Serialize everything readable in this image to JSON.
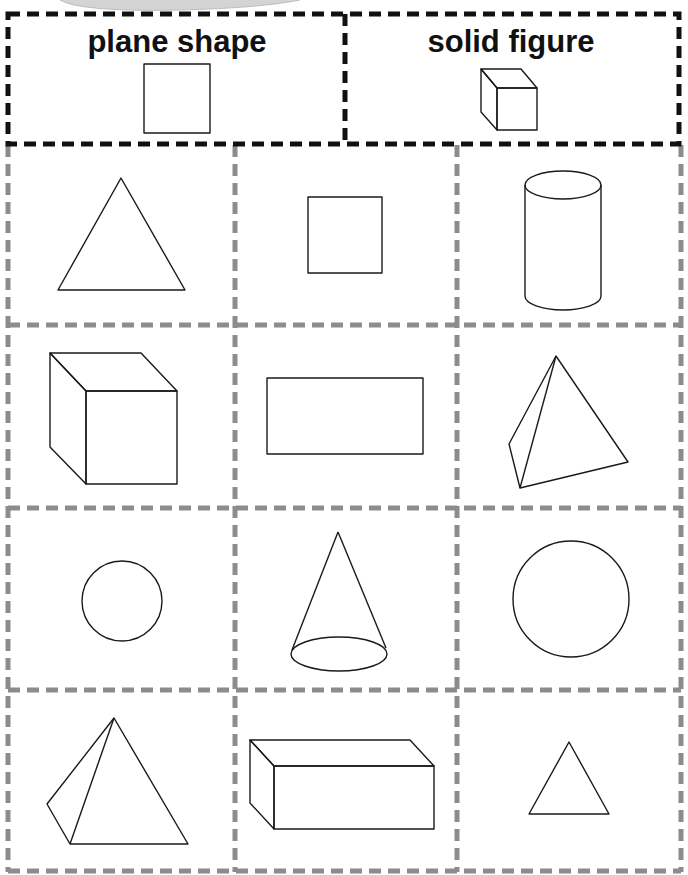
{
  "header": {
    "columns": [
      {
        "label": "plane shape",
        "example_icon": "square-icon"
      },
      {
        "label": "solid figure",
        "example_icon": "cube-icon"
      }
    ]
  },
  "grid": {
    "rows": 4,
    "cols": 3,
    "cells": [
      {
        "row": 0,
        "col": 0,
        "shape": "triangle",
        "type": "plane"
      },
      {
        "row": 0,
        "col": 1,
        "shape": "square",
        "type": "plane"
      },
      {
        "row": 0,
        "col": 2,
        "shape": "cylinder",
        "type": "solid"
      },
      {
        "row": 1,
        "col": 0,
        "shape": "cube",
        "type": "solid"
      },
      {
        "row": 1,
        "col": 1,
        "shape": "rectangle",
        "type": "plane"
      },
      {
        "row": 1,
        "col": 2,
        "shape": "triangular pyramid",
        "type": "solid"
      },
      {
        "row": 2,
        "col": 0,
        "shape": "circle",
        "type": "plane"
      },
      {
        "row": 2,
        "col": 1,
        "shape": "cone",
        "type": "solid"
      },
      {
        "row": 2,
        "col": 2,
        "shape": "circle",
        "type": "plane"
      },
      {
        "row": 3,
        "col": 0,
        "shape": "triangular pyramid",
        "type": "solid"
      },
      {
        "row": 3,
        "col": 1,
        "shape": "rectangular prism",
        "type": "solid"
      },
      {
        "row": 3,
        "col": 2,
        "shape": "triangle",
        "type": "plane"
      }
    ]
  },
  "colors": {
    "header_border": "#111111",
    "grid_border": "#8c8c8c",
    "shape_stroke": "#1a1a1a",
    "background": "#ffffff"
  }
}
